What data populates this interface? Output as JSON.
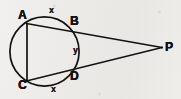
{
  "figure": {
    "background_color": "#edecea",
    "stroke_color": "#121212",
    "width": 181,
    "height": 99
  },
  "circle": {
    "name": "circle",
    "cx": 44.5,
    "cy": 51.5,
    "r": 34.6,
    "stroke_width": 1.6
  },
  "points": {
    "A": {
      "label": "A",
      "x": 27.0,
      "y": 23.8
    },
    "B": {
      "label": "B",
      "x": 70.0,
      "y": 26.4
    },
    "C": {
      "label": "C",
      "x": 27.0,
      "y": 80.6
    },
    "D": {
      "label": "D",
      "x": 70.0,
      "y": 72.8
    },
    "P": {
      "label": "P",
      "x": 162.0,
      "y": 47.5
    }
  },
  "segments": [
    {
      "name": "chord-AC",
      "from": "A",
      "to": "C",
      "x1": 27.0,
      "y1": 23.8,
      "x2": 27.0,
      "y2": 80.6
    },
    {
      "name": "secant-APB",
      "from": "A",
      "to": "P",
      "x1": 27.0,
      "y1": 23.8,
      "x2": 162.0,
      "y2": 47.5
    },
    {
      "name": "secant-CPD",
      "from": "C",
      "to": "P",
      "x1": 27.0,
      "y1": 80.6,
      "x2": 162.0,
      "y2": 47.5
    }
  ],
  "arc_labels": {
    "top": "x",
    "middle": "y",
    "bottom": "x"
  }
}
